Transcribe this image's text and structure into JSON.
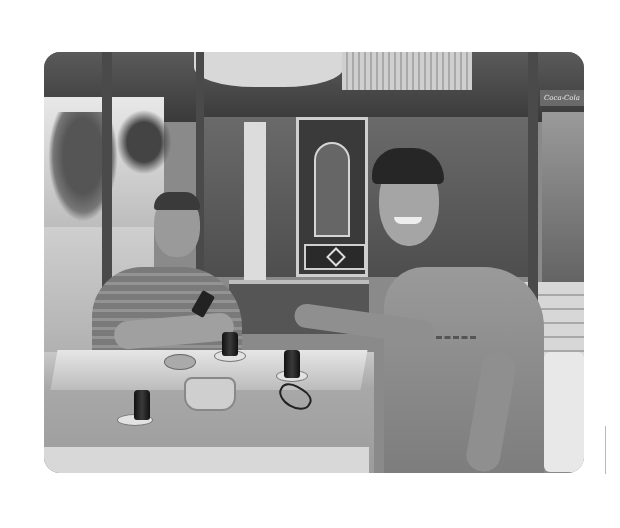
{
  "image": {
    "kind": "photograph",
    "color_mode": "grayscale",
    "description": "Two people seated at an outdoor cafe table with Turkish tea glasses; an older man on the left holding a phone and a smiling young man on the right stirring tea.",
    "sign_text": "Coca-Cola",
    "colors": {
      "page_background": "#ffffff",
      "photo_mid_tone": "#8a8a8a",
      "divider_line": "#b8b8b8"
    }
  }
}
